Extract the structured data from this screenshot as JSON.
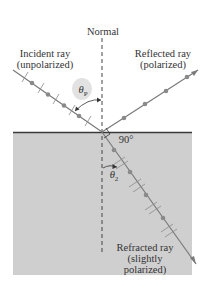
{
  "labels": {
    "normal": "Normal",
    "incident_line1": "Incident ray",
    "incident_line2": "(unpolarized)",
    "reflected_line1": "Reflected ray",
    "reflected_line2": "(polarized)",
    "refracted_line1": "Refracted ray",
    "refracted_line2": "(slightly",
    "refracted_line3": "polarized)",
    "theta_p": "θ",
    "theta_p_sub": "P",
    "theta_2": "θ",
    "theta_2_sub": "2",
    "right_angle": "90°"
  },
  "colors": {
    "medium_fill": "#cfcfcf",
    "surface_line": "#3a3a3a",
    "ray": "#7a7a7a",
    "dot": "#8a8a8a",
    "normal_line": "#444444",
    "theta_bubble": "#e2e2e2"
  },
  "geometry": {
    "interface_point": [
      102,
      132
    ],
    "incident_start": [
      13,
      70
    ],
    "reflected_end": [
      198,
      70
    ],
    "refracted_end": [
      196,
      264
    ]
  }
}
